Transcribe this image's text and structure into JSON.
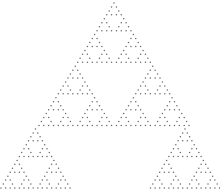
{
  "figure": {
    "background": "#ffffff",
    "dot_color": "#6a6a6a",
    "dot_radius": 0.75
  },
  "triangles": [
    {
      "name": "upper",
      "rows": 32,
      "apex_x": 114,
      "apex_y": 3,
      "dx": 4.84,
      "dy": 3.95
    },
    {
      "name": "lower-left",
      "rows": 16,
      "apex_x": 35.5,
      "apex_y": 129,
      "dx": 4.6,
      "dy": 3.93
    },
    {
      "name": "lower-right",
      "rows": 16,
      "apex_x": 185,
      "apex_y": 129,
      "dx": 4.6,
      "dy": 3.93
    }
  ]
}
